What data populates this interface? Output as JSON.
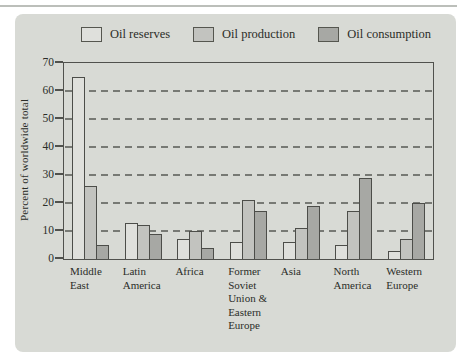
{
  "chart_data": {
    "type": "bar",
    "title": "",
    "xlabel": "",
    "ylabel": "Percent of worldwide total",
    "ylim": [
      0,
      70
    ],
    "yticks": [
      0,
      10,
      20,
      30,
      40,
      50,
      60,
      70
    ],
    "grid": "horizontal dashed gridlines at 10-60",
    "legend_position": "top",
    "categories": [
      "Middle East",
      "Latin America",
      "Africa",
      "Former Soviet Union & Eastern Europe",
      "Asia",
      "North America",
      "Western Europe"
    ],
    "category_label_lines": [
      [
        "Middle",
        "East"
      ],
      [
        "Latin",
        "America"
      ],
      [
        "Africa"
      ],
      [
        "Former",
        "Soviet",
        "Union &",
        "Eastern",
        "Europe"
      ],
      [
        "Asia"
      ],
      [
        "North",
        "America"
      ],
      [
        "Western",
        "Europe"
      ]
    ],
    "series": [
      {
        "name": "Oil reserves",
        "color": "#dfe0dc",
        "values": [
          65,
          13,
          7,
          6,
          6,
          5,
          3
        ]
      },
      {
        "name": "Oil production",
        "color": "#c2c3bf",
        "values": [
          26,
          12,
          10,
          21,
          11,
          17,
          7
        ]
      },
      {
        "name": "Oil consumption",
        "color": "#a7a8a4",
        "values": [
          5,
          9,
          4,
          17,
          19,
          29,
          20
        ]
      }
    ]
  },
  "colors": {
    "panel_background": "#d8dad5",
    "bar_border": "#4c4d49",
    "plot_border": "#50514d",
    "gridline": "#777974",
    "text": "#2b2d28",
    "top_rule": "#bcbfba"
  }
}
